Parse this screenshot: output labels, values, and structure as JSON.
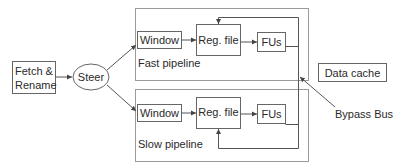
{
  "diagram": {
    "fetch": {
      "line1": "Fetch &",
      "line2": "Rename"
    },
    "steer": {
      "label": "Steer"
    },
    "fast_pipeline": {
      "label": "Fast pipeline",
      "window": "Window",
      "regfile": "Reg. file",
      "fus": "FUs"
    },
    "slow_pipeline": {
      "label": "Slow pipeline",
      "window": "Window",
      "regfile": "Reg. file",
      "fus": "FUs"
    },
    "data_cache": {
      "label": "Data cache"
    },
    "bypass_bus": {
      "label": "Bypass Bus"
    },
    "colors": {
      "stroke": "#555555",
      "container_stroke": "#999999",
      "text": "#2a2a2a",
      "background": "#ffffff"
    }
  }
}
